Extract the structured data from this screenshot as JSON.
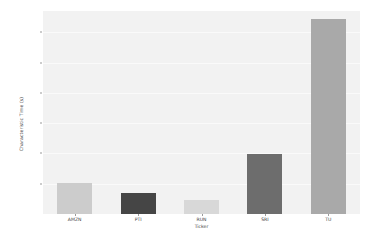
{
  "chart_data": {
    "type": "bar",
    "title": "",
    "xlabel": "Ticker",
    "ylabel": "Characteristic Time (s)",
    "categories": [
      "AMZN",
      "PTI",
      "RUN",
      "SRI",
      "TU"
    ],
    "values": [
      205,
      140,
      95,
      395,
      1290
    ],
    "bar_colors": [
      "#cccccc",
      "#454545",
      "#d8d8d8",
      "#6d6d6d",
      "#a9a9a9"
    ],
    "ylim": [
      0,
      1340
    ],
    "yticks": [
      200,
      400,
      600,
      800,
      1000,
      1200
    ],
    "ytick_labels": [
      "200",
      "400",
      "600",
      "800",
      "1000",
      "1200"
    ],
    "grid": true,
    "legend": "none",
    "plot_background": "#f2f2f2",
    "figure_background": "#ffffff",
    "tick_color": "#3d3d3d"
  }
}
